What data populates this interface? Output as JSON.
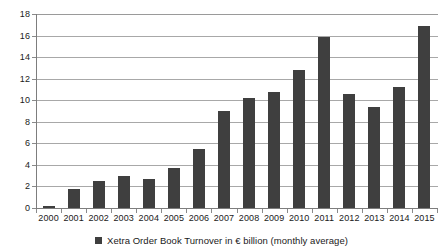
{
  "chart_data": {
    "type": "bar",
    "title": "",
    "subtitle": "",
    "xlabel": "",
    "ylabel": "",
    "categories": [
      "2000",
      "2001",
      "2002",
      "2003",
      "2004",
      "2005",
      "2006",
      "2007",
      "2008",
      "2009",
      "2010",
      "2011",
      "2012",
      "2013",
      "2014",
      "2015"
    ],
    "series": [
      {
        "name": "Xetra Order Book Turnover in € billion (monthly average)",
        "color": "#3f3f3f",
        "values": [
          0.15,
          1.75,
          2.5,
          3.0,
          2.65,
          3.7,
          5.5,
          9.0,
          10.2,
          10.8,
          12.8,
          15.9,
          10.6,
          9.4,
          11.2,
          16.9
        ]
      }
    ],
    "ylim": [
      0,
      18
    ],
    "ytick_step": 2,
    "yticks": [
      0,
      2,
      4,
      6,
      8,
      10,
      12,
      14,
      16,
      18
    ],
    "ytick_labels": [
      "0",
      "2",
      "4",
      "6",
      "8",
      "10",
      "12",
      "14",
      "16",
      "18"
    ],
    "grid": "horizontal",
    "grid_color": "#a8a8a8",
    "axis_color": "#7d7d7d",
    "legend_position": "bottom-center",
    "legend": [
      {
        "label": "Xetra Order Book Turnover in € billion (monthly average)",
        "marker": "square",
        "color": "#3f3f3f"
      }
    ],
    "annotations": []
  },
  "colors": {
    "bar": "#3f3f3f",
    "grid": "#a8a8a8",
    "axis": "#7d7d7d",
    "text": "#1a1a1a",
    "background": "#ffffff"
  }
}
